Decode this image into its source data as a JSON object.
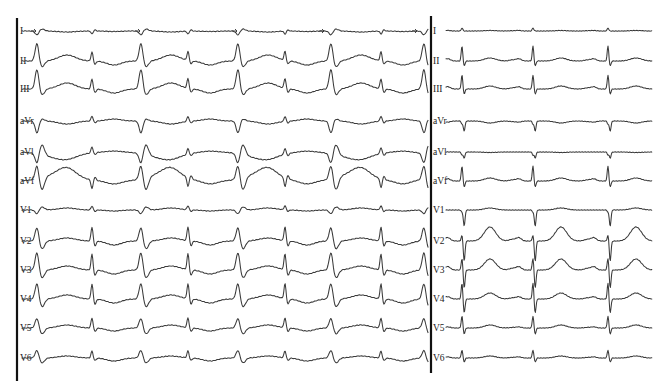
{
  "figure": {
    "type": "12-lead ECG",
    "panels": [
      {
        "id": "left",
        "description": "Alternating wide (pre-excited/paced-like) and narrow complexes",
        "x_start": 20,
        "x_end": 428,
        "border_x": 17,
        "wide_beats_x": [
          37,
          141,
          238,
          331,
          424
        ],
        "narrow_beats_x": [
          92,
          188,
          285,
          381
        ],
        "arrow_markers_lead_I_x": [
          37,
          141,
          238,
          325,
          418
        ]
      },
      {
        "id": "right",
        "description": "Narrow QRS sinus rhythm with peaked T waves in V2-V3",
        "x_start": 438,
        "x_end": 652,
        "border_x": 431,
        "beats_x": [
          462,
          533,
          608
        ]
      }
    ],
    "leads": [
      {
        "name": "I",
        "label": "I",
        "y": 31
      },
      {
        "name": "II",
        "label": "II",
        "y": 61
      },
      {
        "name": "III",
        "label": "III",
        "y": 89
      },
      {
        "name": "aVr",
        "label": "aVr",
        "y": 121
      },
      {
        "name": "aVl",
        "label": "aVl",
        "y": 152
      },
      {
        "name": "aVf",
        "label": "aVf",
        "y": 181
      },
      {
        "name": "V1",
        "label": "V1",
        "y": 210
      },
      {
        "name": "V2",
        "label": "V2",
        "y": 241
      },
      {
        "name": "V3",
        "label": "V3",
        "y": 270
      },
      {
        "name": "V4",
        "label": "V4",
        "y": 299
      },
      {
        "name": "V5",
        "label": "V5",
        "y": 328
      },
      {
        "name": "V6",
        "label": "V6",
        "y": 358
      }
    ],
    "right_labels": [
      "I",
      "II",
      "III",
      "aVr",
      "aVl",
      "aVf",
      "V1",
      "V2",
      "V3",
      "V4",
      "V5",
      "V6"
    ],
    "colors": {
      "trace": "#3a3a3a",
      "border": "#111111",
      "background": "#ffffff"
    }
  }
}
